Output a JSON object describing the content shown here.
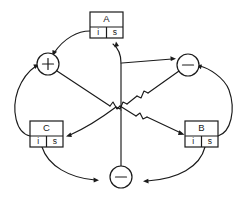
{
  "diagram": {
    "background_color": "#ffffff",
    "line_color": "#1a1a1a",
    "nodes": {
      "box_a": {
        "name": "A",
        "inherited_label": "i",
        "synthesized_label": "s",
        "x": 90,
        "y": 12,
        "width": 33,
        "height": 26
      },
      "box_c": {
        "name": "C",
        "inherited_label": "i",
        "synthesized_label": "s",
        "x": 30,
        "y": 121,
        "width": 33,
        "height": 26
      },
      "box_b": {
        "name": "B",
        "inherited_label": "i",
        "synthesized_label": "s",
        "x": 185,
        "y": 121,
        "width": 33,
        "height": 26
      },
      "op_plus": {
        "symbol": "+",
        "cx": 48,
        "cy": 64,
        "r": 11
      },
      "op_minus_right": {
        "symbol": "−",
        "cx": 188,
        "cy": 65,
        "r": 11
      },
      "op_minus_bottom": {
        "symbol": "−",
        "cx": 121,
        "cy": 177,
        "r": 11
      }
    },
    "edges": [
      {
        "id": "a-i-to-plus",
        "from": "box_a.i",
        "to": "op_plus",
        "style": "curve"
      },
      {
        "id": "plus-to-b-i",
        "from": "op_plus",
        "to": "box_b.i",
        "style": "diagonal"
      },
      {
        "id": "c-to-plus",
        "from": "box_c",
        "to": "op_plus",
        "style": "curve"
      },
      {
        "id": "center-to-minus-r",
        "from": "center",
        "to": "op_minus_right",
        "style": "straight"
      },
      {
        "id": "minus-r-to-c-s",
        "from": "op_minus_right",
        "to": "box_c.s",
        "style": "diagonal"
      },
      {
        "id": "b-to-minus-r",
        "from": "box_b",
        "to": "op_minus_right",
        "style": "curve"
      },
      {
        "id": "vertical-to-a-s",
        "from": "op_minus_bottom",
        "to": "box_a.s",
        "style": "vertical"
      },
      {
        "id": "c-to-minus-b",
        "from": "box_c",
        "to": "op_minus_bottom",
        "style": "curve"
      },
      {
        "id": "b-to-minus-b",
        "from": "box_b",
        "to": "op_minus_bottom",
        "style": "curve"
      }
    ]
  }
}
